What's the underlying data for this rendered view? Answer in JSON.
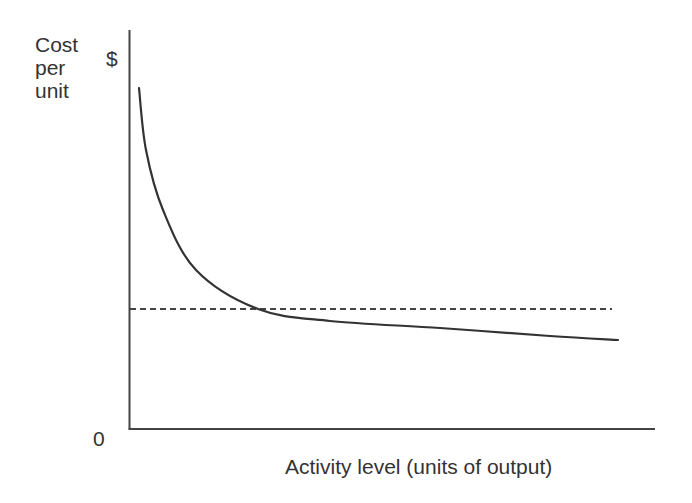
{
  "chart_data": {
    "type": "line",
    "title": "",
    "xlabel": "Activity level (units of output)",
    "ylabel": "Cost per unit",
    "ylabel_lines": [
      "Cost",
      "per",
      "unit"
    ],
    "y_unit": "$",
    "origin_label": "0",
    "grid": false,
    "legend": null,
    "series": [
      {
        "name": "Average fixed cost per unit",
        "style": "solid",
        "description": "Decreasing hyperbolic curve, steep at low activity, flattening at high activity",
        "points_px": [
          [
            139,
            88
          ],
          [
            146,
            150
          ],
          [
            163,
            210
          ],
          [
            196,
            270
          ],
          [
            258,
            309
          ],
          [
            330,
            321
          ],
          [
            440,
            328
          ],
          [
            550,
            336
          ],
          [
            618,
            340
          ]
        ]
      },
      {
        "name": "Variable cost per unit",
        "style": "dashed",
        "description": "Constant horizontal line",
        "points_px": [
          [
            130,
            309
          ],
          [
            612,
            309
          ]
        ]
      }
    ],
    "annotations": []
  },
  "labels": {
    "y_lines": [
      "Cost",
      "per",
      "unit"
    ],
    "dollar": "$",
    "zero": "0",
    "x": "Activity level (units of output)"
  },
  "colors": {
    "axis": "#444444",
    "curve": "#333333",
    "dashed": "#444444",
    "text": "#333333"
  }
}
